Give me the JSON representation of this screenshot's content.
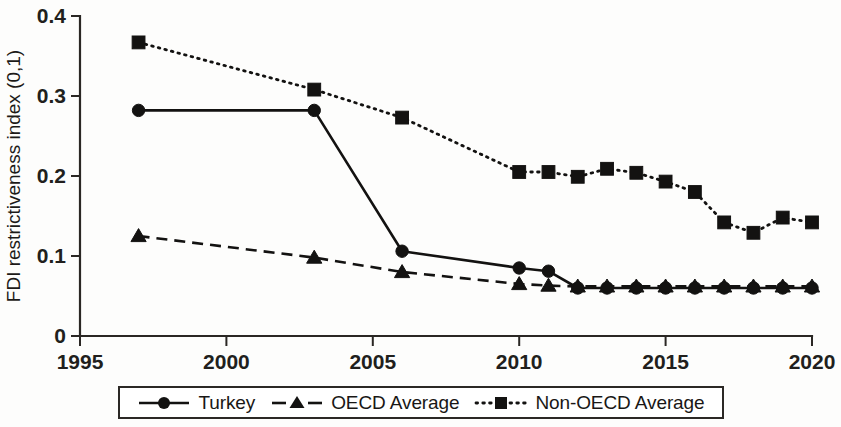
{
  "chart_data": {
    "type": "line",
    "title": "",
    "xlabel": "",
    "ylabel": "FDI restrictiveness index (0,1)",
    "xlim": [
      1995,
      2020
    ],
    "ylim": [
      0,
      0.4
    ],
    "xticks": [
      1995,
      2000,
      2005,
      2010,
      2015,
      2020
    ],
    "xtick_labels": [
      "1995",
      "2000",
      "2005",
      "2010",
      "2015",
      "2020"
    ],
    "yticks": [
      0,
      0.1,
      0.2,
      0.3,
      0.4
    ],
    "ytick_labels": [
      "0",
      "0.1",
      "0.2",
      "0.3",
      "0.4"
    ],
    "grid": false,
    "legend_position": "below-axes",
    "series": [
      {
        "name": "Turkey",
        "marker": "circle",
        "linestyle": "solid",
        "color": "#131211",
        "x": [
          1997,
          2003,
          2006,
          2010,
          2011,
          2012,
          2013,
          2014,
          2015,
          2016,
          2017,
          2018,
          2019,
          2020
        ],
        "values": [
          0.282,
          0.282,
          0.106,
          0.085,
          0.081,
          0.06,
          0.06,
          0.06,
          0.06,
          0.06,
          0.06,
          0.06,
          0.06,
          0.06
        ]
      },
      {
        "name": "OECD Average",
        "marker": "triangle",
        "linestyle": "dashed",
        "color": "#131211",
        "x": [
          1997,
          2003,
          2006,
          2010,
          2011,
          2012,
          2013,
          2014,
          2015,
          2016,
          2017,
          2018,
          2019,
          2020
        ],
        "values": [
          0.125,
          0.098,
          0.08,
          0.065,
          0.063,
          0.062,
          0.062,
          0.062,
          0.062,
          0.062,
          0.062,
          0.062,
          0.062,
          0.062
        ]
      },
      {
        "name": "Non-OECD Average",
        "marker": "square",
        "linestyle": "dotted",
        "color": "#131211",
        "x": [
          1997,
          2003,
          2006,
          2010,
          2011,
          2012,
          2013,
          2014,
          2015,
          2016,
          2017,
          2018,
          2019,
          2020
        ],
        "values": [
          0.367,
          0.308,
          0.273,
          0.205,
          0.205,
          0.199,
          0.209,
          0.204,
          0.193,
          0.18,
          0.142,
          0.129,
          0.148,
          0.142
        ]
      }
    ]
  },
  "legend": {
    "items": [
      {
        "label": "Turkey",
        "marker": "circle-marker-icon",
        "linestyle": "solid"
      },
      {
        "label": "OECD Average",
        "marker": "triangle-marker-icon",
        "linestyle": "dashed"
      },
      {
        "label": "Non-OECD Average",
        "marker": "square-marker-icon",
        "linestyle": "dotted"
      }
    ]
  }
}
